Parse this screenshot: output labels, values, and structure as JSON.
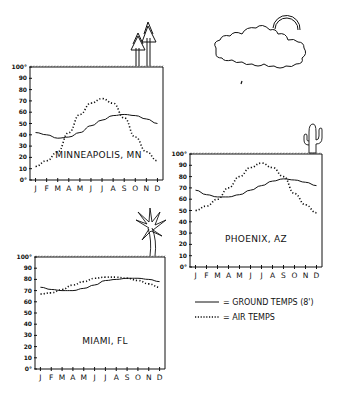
{
  "legend": {
    "ground_label": "= GROUND TEMPS (8')",
    "air_label": "= AIR TEMPS"
  },
  "months": [
    "J",
    "F",
    "M",
    "A",
    "M",
    "J",
    "J",
    "A",
    "S",
    "O",
    "N",
    "D"
  ],
  "y_ticks": [
    "0°",
    "10",
    "20",
    "30",
    "40",
    "50",
    "60",
    "70",
    "80",
    "90",
    "100°"
  ],
  "charts": [
    {
      "city": "MINNEAPOLIS, MN"
    },
    {
      "city": "PHOENIX, AZ"
    },
    {
      "city": "MIAMI, FL"
    }
  ],
  "chart_data": [
    {
      "type": "line",
      "title": "MINNEAPOLIS, MN",
      "categories": [
        "J",
        "F",
        "M",
        "A",
        "M",
        "J",
        "J",
        "A",
        "S",
        "O",
        "N",
        "D"
      ],
      "xlabel": "",
      "ylabel": "",
      "ylim": [
        0,
        100
      ],
      "series": [
        {
          "name": "Ground temps (8')",
          "style": "solid",
          "values": [
            42,
            40,
            37,
            38,
            42,
            48,
            53,
            57,
            58,
            57,
            54,
            50
          ]
        },
        {
          "name": "Air temps",
          "style": "dotted",
          "values": [
            12,
            17,
            25,
            42,
            58,
            68,
            72,
            68,
            55,
            38,
            25,
            17
          ]
        }
      ],
      "grid": false,
      "legend_position": "bottom-right (shared)"
    },
    {
      "type": "line",
      "title": "PHOENIX, AZ",
      "categories": [
        "J",
        "F",
        "M",
        "A",
        "M",
        "J",
        "J",
        "A",
        "S",
        "O",
        "N",
        "D"
      ],
      "xlabel": "",
      "ylabel": "",
      "ylim": [
        0,
        100
      ],
      "series": [
        {
          "name": "Ground temps (8')",
          "style": "solid",
          "values": [
            68,
            64,
            62,
            62,
            64,
            68,
            72,
            76,
            78,
            77,
            75,
            72
          ]
        },
        {
          "name": "Air temps",
          "style": "dotted",
          "values": [
            50,
            54,
            60,
            70,
            80,
            88,
            92,
            88,
            80,
            65,
            55,
            48
          ]
        }
      ],
      "grid": false,
      "legend_position": "bottom-right (shared)"
    },
    {
      "type": "line",
      "title": "MIAMI, FL",
      "categories": [
        "J",
        "F",
        "M",
        "A",
        "M",
        "J",
        "J",
        "A",
        "S",
        "O",
        "N",
        "D"
      ],
      "xlabel": "",
      "ylabel": "",
      "ylim": [
        0,
        100
      ],
      "series": [
        {
          "name": "Ground temps (8')",
          "style": "solid",
          "values": [
            73,
            71,
            70,
            70,
            72,
            75,
            79,
            80,
            81,
            81,
            80,
            78
          ]
        },
        {
          "name": "Air temps",
          "style": "dotted",
          "values": [
            67,
            68,
            71,
            75,
            78,
            81,
            82,
            82,
            81,
            79,
            76,
            73
          ]
        }
      ],
      "grid": false,
      "legend_position": "bottom-right (shared)"
    }
  ]
}
